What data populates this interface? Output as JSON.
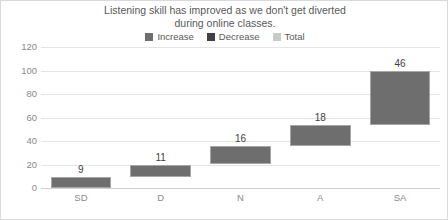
{
  "chart_data": {
    "type": "bar",
    "subtype": "waterfall",
    "title": "Listening skill has improved as we don't get diverted\nduring online classes.",
    "xlabel": "",
    "ylabel": "",
    "categories": [
      "SD",
      "D",
      "N",
      "A",
      "SA"
    ],
    "values": [
      9,
      11,
      16,
      18,
      46
    ],
    "cumulative_start": [
      0,
      9,
      20,
      36,
      54
    ],
    "cumulative_end": [
      9,
      20,
      36,
      54,
      100
    ],
    "data_labels": [
      "9",
      "11",
      "16",
      "18",
      "46"
    ],
    "ylim": [
      0,
      120
    ],
    "ytick_step": 20,
    "yticks": [
      0,
      20,
      40,
      60,
      80,
      100,
      120
    ],
    "ytick_labels": [
      "0",
      "20",
      "40",
      "60",
      "80",
      "100",
      "120"
    ],
    "grid": true,
    "grid_axis": "y",
    "legend_position": "top",
    "legend": [
      {
        "name": "Increase",
        "color": "#6e6e6e"
      },
      {
        "name": "Decrease",
        "color": "#404040"
      },
      {
        "name": "Total",
        "color": "#c9c9c9"
      }
    ],
    "bar_color": "#6e6e6e",
    "bar_border_color": "#a6a6a6",
    "gridline_color": "#e4e4e4",
    "axis_text_color": "#8a8a8a",
    "title_color": "#595959",
    "plot_background": "#ffffff",
    "frame_border_color": "#d9d9d9"
  }
}
